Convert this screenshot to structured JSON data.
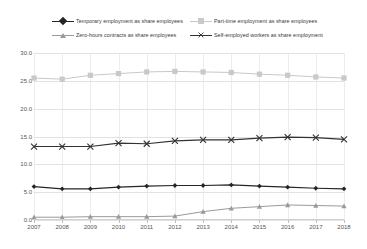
{
  "chart_data": {
    "type": "line",
    "title": "",
    "subtitle": "",
    "xlabel": "",
    "ylabel": "",
    "grid": true,
    "legend_position": "top",
    "categories": [
      "2007",
      "2008",
      "2009",
      "2010",
      "2011",
      "2012",
      "2013",
      "2014",
      "2015",
      "2016",
      "2017",
      "2018"
    ],
    "ylim": [
      0.0,
      30.0
    ],
    "ytick_labels": [
      "0.0",
      "5.0",
      "10.0",
      "15.0",
      "20.0",
      "25.0",
      "30.0"
    ],
    "ytick_values": [
      0.0,
      5.0,
      10.0,
      15.0,
      20.0,
      25.0,
      30.0
    ],
    "series": [
      {
        "name": "Temporary employment as share employees",
        "marker": "diamond",
        "color": "#262626",
        "values": [
          6.0,
          5.6,
          5.6,
          5.9,
          6.1,
          6.2,
          6.2,
          6.3,
          6.1,
          5.9,
          5.7,
          5.6
        ]
      },
      {
        "name": "Part-time employment as share employees",
        "marker": "square",
        "color": "#c9c9c9",
        "values": [
          25.5,
          25.3,
          26.0,
          26.3,
          26.6,
          26.7,
          26.6,
          26.5,
          26.2,
          26.0,
          25.7,
          25.5
        ]
      },
      {
        "name": "Zero-hours contracts as share employees",
        "marker": "triangle",
        "color": "#9a9a9a",
        "values": [
          0.5,
          0.5,
          0.6,
          0.6,
          0.6,
          0.7,
          1.5,
          2.1,
          2.4,
          2.7,
          2.6,
          2.5
        ]
      },
      {
        "name": "Self-employed workers as share employment",
        "marker": "x",
        "color": "#333333",
        "values": [
          13.2,
          13.2,
          13.2,
          13.8,
          13.7,
          14.2,
          14.4,
          14.4,
          14.7,
          14.9,
          14.8,
          14.5
        ]
      }
    ]
  }
}
